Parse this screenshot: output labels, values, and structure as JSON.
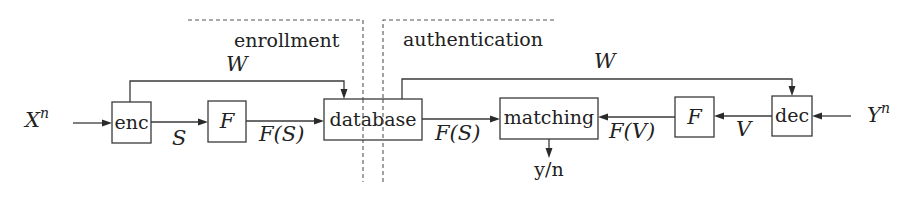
{
  "regions": {
    "enrollment": "enrollment",
    "authentication": "authentication"
  },
  "blocks": {
    "enc": "enc",
    "f_left": "F",
    "database": "database",
    "matching": "matching",
    "f_right": "F",
    "dec": "dec"
  },
  "signals": {
    "input_left": "X",
    "input_left_sup": "n",
    "input_right": "Y",
    "input_right_sup": "n",
    "s": "S",
    "fs_left": "F(S)",
    "fs_right": "F(S)",
    "fv": "F(V)",
    "v": "V",
    "w_left": "W",
    "w_right": "W",
    "output": "y/n"
  }
}
